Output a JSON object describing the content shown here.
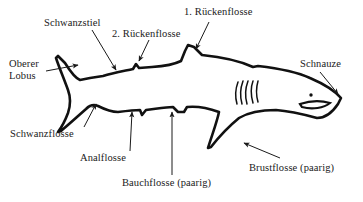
{
  "figure": {
    "language": "de",
    "background_color": "#ffffff",
    "ink_color": "#111111",
    "text_color": "#1a1a1a"
  },
  "labels": {
    "dorsal_1": "1. Rückenflosse",
    "dorsal_2": "2. Rückenflosse",
    "caudal_peduncle": "Schwanzstiel",
    "upper_lobe_line1": "Oberer",
    "upper_lobe_line2": "Lobus",
    "caudal_fin": "Schwanzflosse",
    "anal_fin": "Analflosse",
    "pelvic_fin": "Bauchflosse (paarig)",
    "pectoral_fin": "Brustflosse (paarig)",
    "snout": "Schnauze"
  },
  "parts": [
    {
      "id": "dorsal-fin-1",
      "label": "1. Rückenflosse"
    },
    {
      "id": "dorsal-fin-2",
      "label": "2. Rückenflosse"
    },
    {
      "id": "caudal-peduncle",
      "label": "Schwanzstiel"
    },
    {
      "id": "upper-lobe",
      "label": "Oberer Lobus"
    },
    {
      "id": "caudal-fin",
      "label": "Schwanzflosse"
    },
    {
      "id": "anal-fin",
      "label": "Analflosse"
    },
    {
      "id": "pelvic-fin",
      "label": "Bauchflosse (paarig)"
    },
    {
      "id": "pectoral-fin",
      "label": "Brustflosse (paarig)"
    },
    {
      "id": "snout",
      "label": "Schnauze"
    }
  ],
  "drawing": {
    "body_outline": "M 252 66 C 238 60, 218 56, 200 55 L 193 47 L 186 47 L 184 52 L 180 62 L 170 65 L 160 66 L 150 67 L 142 68 L 136 69 L 134 64 L 132 69 L 128 70 L 118 72 L 110 74 L 104 76 L 98 77 L 92 78 L 87 79 L 83 80 L 80 81 L 76 80 L 72 76 L 68 70 L 64 64 L 61 60 L 58 57 L 56 58 L 58 64 L 62 74 L 66 84 L 69 92 L 71 99 L 70 106 L 67 114 L 63 121 L 60 127 L 58 131 L 61 130 L 67 125 L 74 119 L 80 113 L 85 108 L 89 105 L 93 104 L 98 106 L 104 109 L 108 111 L 112 112 L 118 112 L 126 111 L 134 110 L 140 110 L 142 115 L 145 110 L 150 109 L 158 108 L 166 107 L 172 107 L 176 110 L 180 113 L 184 112 L 186 108 L 192 107 L 200 107 L 208 108 L 216 110 L 220 113 L 218 120 L 214 130 L 210 140 L 208 148 L 210 147 L 216 140 L 224 131 L 232 123 L 240 117 L 248 113 L 256 111 L 266 110 L 276 110 L 286 111 L 296 113 L 306 116 L 316 118 L 324 117 L 330 112 L 336 104 L 340 98 L 336 93 L 328 87 L 318 81 L 306 76 L 292 71 L 276 68 L 262 66 Z",
    "gill_count": 5,
    "eye": {
      "cx": 311,
      "cy": 95,
      "r": 1.6
    }
  },
  "annotations": [
    {
      "id": "dorsal-1-leader",
      "from": [
        206,
        22
      ],
      "to": [
        196,
        50
      ]
    },
    {
      "id": "dorsal-2-leader",
      "from": [
        147,
        40
      ],
      "to": [
        140,
        63
      ]
    },
    {
      "id": "peduncle-leader",
      "from": [
        90,
        30
      ],
      "to": [
        117,
        71
      ]
    },
    {
      "id": "upper-lobe-leader",
      "from": [
        48,
        71
      ],
      "to": [
        80,
        66
      ]
    },
    {
      "id": "caudal-leader",
      "from": [
        84,
        127
      ],
      "to": [
        96,
        105
      ]
    },
    {
      "id": "anal-leader",
      "from": [
        130,
        151
      ],
      "to": [
        132,
        110
      ]
    },
    {
      "id": "pelvic-leader",
      "from": [
        172,
        175
      ],
      "to": [
        172,
        110
      ]
    },
    {
      "id": "pectoral-leader",
      "from": [
        278,
        158
      ],
      "to": [
        242,
        143
      ]
    },
    {
      "id": "snout-leader",
      "from": [
        322,
        72
      ],
      "to": [
        340,
        95
      ]
    }
  ]
}
